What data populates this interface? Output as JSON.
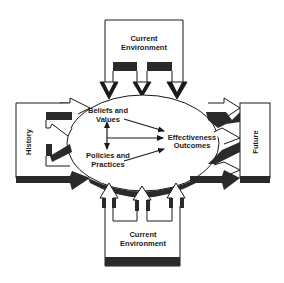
{
  "diagram": {
    "top_box": {
      "line1": "Current",
      "line2": "Environment"
    },
    "bottom_box": {
      "line1": "Current",
      "line2": "Environment"
    },
    "left_box": {
      "label": "History"
    },
    "right_box": {
      "label": "Future"
    },
    "center": {
      "beliefs_line1": "Beliefs and",
      "beliefs_line2": "Values",
      "policies_line1": "Policies and",
      "policies_line2": "Practices",
      "outcomes_line1": "Effectiveness",
      "outcomes_line2": "Outcomes"
    },
    "colors": {
      "stroke": "#1a1a1a",
      "dark_band": "#2a2a2a",
      "background": "#ffffff"
    }
  }
}
